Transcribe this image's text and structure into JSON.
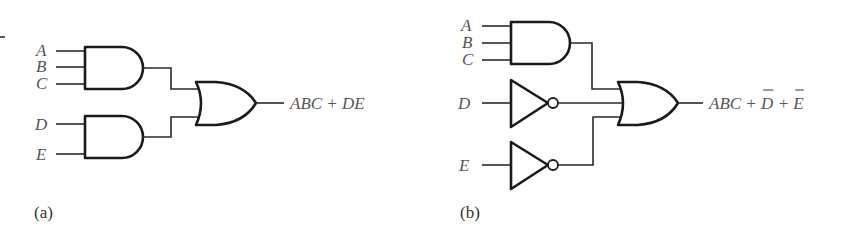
{
  "diagram_a": {
    "caption": "(a)",
    "inputs": [
      {
        "label": "A",
        "x": 36,
        "y": 56
      },
      {
        "label": "B",
        "x": 36,
        "y": 72
      },
      {
        "label": "C",
        "x": 36,
        "y": 89
      },
      {
        "label": "D",
        "x": 35,
        "y": 130
      },
      {
        "label": "E",
        "x": 36,
        "y": 160
      }
    ],
    "output_expression": "ABC + DE",
    "gates": [
      {
        "type": "AND",
        "inputs": [
          "A",
          "B",
          "C"
        ]
      },
      {
        "type": "AND",
        "inputs": [
          "D",
          "E"
        ]
      },
      {
        "type": "OR",
        "inputs": [
          "ABC",
          "DE"
        ]
      }
    ]
  },
  "diagram_b": {
    "caption": "(b)",
    "inputs": [
      {
        "label": "A",
        "x": 461,
        "y": 31
      },
      {
        "label": "B",
        "x": 462,
        "y": 48
      },
      {
        "label": "C",
        "x": 462,
        "y": 65
      },
      {
        "label": "D",
        "x": 458,
        "y": 109
      },
      {
        "label": "E",
        "x": 459,
        "y": 171
      }
    ],
    "output_expression_parts": [
      {
        "text": "ABC",
        "overbar": false
      },
      {
        "text": " + ",
        "overbar": false
      },
      {
        "text": "D",
        "overbar": true
      },
      {
        "text": " + ",
        "overbar": false
      },
      {
        "text": "E",
        "overbar": true
      }
    ],
    "output_expression": "ABC + D̅ + E̅",
    "gates": [
      {
        "type": "AND",
        "inputs": [
          "A",
          "B",
          "C"
        ]
      },
      {
        "type": "NOT",
        "inputs": [
          "D"
        ]
      },
      {
        "type": "NOT",
        "inputs": [
          "E"
        ]
      },
      {
        "type": "OR",
        "inputs": [
          "ABC",
          "D'",
          "E'"
        ]
      }
    ]
  },
  "colors": {
    "gate_stroke": "#1a1a1a",
    "wire": "#2a2a2a",
    "label": "#555555",
    "background": "#ffffff"
  }
}
